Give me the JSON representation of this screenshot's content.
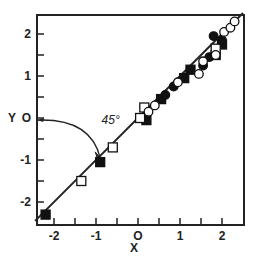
{
  "chart_data": {
    "type": "scatter",
    "title": "",
    "xlabel": "X",
    "ylabel": "Y",
    "xlim": [
      -2.45,
      2.5
    ],
    "ylim": [
      -2.55,
      2.45
    ],
    "grid": false,
    "x_ticks": [
      -2,
      -1.5,
      -1,
      -0.5,
      0,
      0.5,
      1,
      1.5,
      2
    ],
    "x_tick_labels": [
      "-2",
      "-1",
      "O",
      "1",
      "2"
    ],
    "x_tick_label_values": [
      -2,
      -1,
      0,
      1,
      2
    ],
    "y_ticks": [
      -2,
      -1.5,
      -1,
      -0.5,
      0,
      0.5,
      1,
      1.5,
      2
    ],
    "y_tick_labels": [
      "-2",
      "-1",
      "O",
      "1",
      "2"
    ],
    "y_tick_label_values": [
      -2,
      -1,
      0,
      1,
      2
    ],
    "line": {
      "label": "y = x",
      "x": [
        -2.45,
        2.5
      ],
      "y": [
        -2.45,
        2.5
      ]
    },
    "annotations": [
      {
        "text": "45°",
        "x": -0.65,
        "y": -0.15,
        "arrow_from": [
          -2.4,
          -0.05
        ],
        "arrow_to": [
          -0.9,
          -0.95
        ]
      }
    ],
    "series": [
      {
        "name": "filled squares",
        "marker": "square-filled",
        "points": [
          [
            -2.2,
            -2.3
          ],
          [
            -0.9,
            -1.05
          ],
          [
            0.2,
            -0.05
          ],
          [
            0.55,
            0.45
          ],
          [
            1.1,
            0.95
          ],
          [
            1.25,
            1.15
          ],
          [
            1.85,
            1.5
          ],
          [
            2.0,
            1.75
          ]
        ]
      },
      {
        "name": "open squares",
        "marker": "square-open",
        "points": [
          [
            -1.35,
            -1.5
          ],
          [
            -0.6,
            -0.7
          ],
          [
            0.05,
            0.0
          ],
          [
            0.15,
            0.25
          ],
          [
            1.85,
            1.65
          ]
        ]
      },
      {
        "name": "filled circles",
        "marker": "circle-filled",
        "points": [
          [
            0.65,
            0.55
          ],
          [
            0.85,
            0.75
          ],
          [
            1.55,
            1.25
          ],
          [
            1.7,
            1.45
          ],
          [
            1.8,
            1.95
          ],
          [
            2.0,
            1.85
          ]
        ]
      },
      {
        "name": "open circles",
        "marker": "circle-open",
        "points": [
          [
            0.25,
            0.15
          ],
          [
            0.4,
            0.3
          ],
          [
            0.95,
            0.85
          ],
          [
            1.45,
            1.05
          ],
          [
            1.55,
            1.35
          ],
          [
            1.85,
            1.5
          ],
          [
            2.05,
            2.05
          ],
          [
            2.2,
            2.15
          ],
          [
            2.3,
            2.3
          ]
        ]
      }
    ]
  }
}
